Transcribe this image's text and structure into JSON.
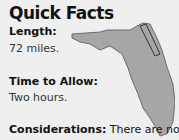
{
  "title": "Quick Facts",
  "facts": [
    {
      "label": "Length:",
      "value": "72 miles."
    },
    {
      "label": "Time to Allow:",
      "value": "Two hours."
    },
    {
      "label": "Considerations:",
      "value": "There are no"
    }
  ],
  "map": {
    "region": "florida-map",
    "fill": "#a6a6a6",
    "stroke": "#555555"
  }
}
